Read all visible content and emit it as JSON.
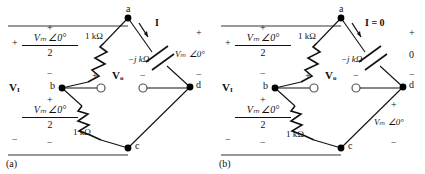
{
  "figure": {
    "type": "circuit-diagram-pair"
  },
  "panels": [
    {
      "id": "a",
      "caption": "(a)",
      "nodes": [
        {
          "name": "a",
          "label": "a",
          "x": 128,
          "y": 18
        },
        {
          "name": "b",
          "label": "b",
          "x": 62,
          "y": 88
        },
        {
          "name": "c",
          "label": "c",
          "x": 128,
          "y": 148
        },
        {
          "name": "d",
          "label": "d",
          "x": 190,
          "y": 87
        }
      ],
      "components": {
        "resistor_top": {
          "label": "1 kΩ"
        },
        "resistor_bottom": {
          "label": "1 kΩ"
        },
        "capacitor": {
          "label": "−j kΩ"
        }
      },
      "sources": {
        "upper": {
          "numerator": "Vₘ ∠0°",
          "denominator": "2",
          "plus": "+",
          "minus": "−"
        },
        "lower": {
          "numerator": "Vₘ ∠0°",
          "denominator": "2",
          "plus": "+",
          "minus": "−"
        }
      },
      "labels": {
        "input_voltage": "V",
        "input_voltage_sub": "I",
        "output_voltage": "V",
        "output_voltage_sub": "o",
        "output_plus": "+",
        "output_minus": "−",
        "current": "I",
        "right_branch_voltage": "Vₘ ∠0°",
        "right_plus": "+",
        "right_minus": "−",
        "left_outer_plus": "+",
        "left_outer_minus": "−"
      }
    },
    {
      "id": "b",
      "caption": "(b)",
      "nodes": [
        {
          "name": "a",
          "label": "a",
          "x": 128,
          "y": 18
        },
        {
          "name": "b",
          "label": "b",
          "x": 62,
          "y": 88
        },
        {
          "name": "c",
          "label": "c",
          "x": 128,
          "y": 148
        },
        {
          "name": "d",
          "label": "d",
          "x": 190,
          "y": 87
        }
      ],
      "components": {
        "resistor_top": {
          "label": "1 kΩ"
        },
        "resistor_bottom": {
          "label": "1 kΩ"
        },
        "capacitor": {
          "label": "−j kΩ"
        }
      },
      "sources": {
        "upper": {
          "numerator": "Vₘ ∠0°",
          "denominator": "2",
          "plus": "+",
          "minus": "−"
        },
        "lower": {
          "numerator": "Vₘ ∠0°",
          "denominator": "2",
          "plus": "+",
          "minus": "−"
        }
      },
      "labels": {
        "input_voltage": "V",
        "input_voltage_sub": "I",
        "output_voltage": "V",
        "output_voltage_sub": "o",
        "output_plus": "+",
        "output_minus": "−",
        "current": "I = 0",
        "capacitor_voltage": "0",
        "lower_right_voltage": "Vₘ ∠0°",
        "right_plus": "+",
        "right_minus": "−",
        "lower_right_plus": "+",
        "lower_right_minus": "−",
        "left_outer_plus": "+",
        "left_outer_minus": "−"
      }
    }
  ],
  "colors": {
    "wire": "#111111",
    "background": "#ffffff",
    "node_fill": "#000000",
    "terminal_stroke": "#555555"
  }
}
